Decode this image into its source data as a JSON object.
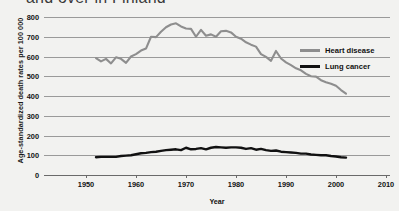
{
  "title": "and over in Finland",
  "chart_data": {
    "type": "line",
    "title": "and over in Finland",
    "xlabel": "Year",
    "ylabel": "Age-standardized death rates per 100 000",
    "xlim": [
      1941.6,
      2010.8
    ],
    "ylim": [
      0,
      800
    ],
    "xticks": [
      1950,
      1960,
      1970,
      1980,
      1990,
      2000,
      2010
    ],
    "yticks": [
      0,
      100,
      200,
      300,
      400,
      500,
      600,
      700,
      800
    ],
    "grid": true,
    "legend_position": "right",
    "colors": {
      "heart_disease": "#8e8e8e",
      "lung_cancer": "#111111",
      "gridline": "#9a9a9a",
      "background": "#f2f2f0"
    },
    "series": [
      {
        "name": "Heart disease",
        "color": "#8e8e8e",
        "x": [
          1952,
          1953,
          1954,
          1955,
          1956,
          1957,
          1958,
          1959,
          1960,
          1961,
          1962,
          1963,
          1964,
          1965,
          1966,
          1967,
          1968,
          1969,
          1970,
          1971,
          1972,
          1973,
          1974,
          1975,
          1976,
          1977,
          1978,
          1979,
          1980,
          1981,
          1982,
          1983,
          1984,
          1985,
          1986,
          1987,
          1988,
          1989,
          1990,
          1991,
          1992,
          1993,
          1994,
          1995,
          1996,
          1997,
          1998,
          1999,
          2000,
          2001,
          2002
        ],
        "values": [
          592,
          575,
          588,
          565,
          596,
          588,
          568,
          600,
          612,
          630,
          640,
          700,
          698,
          725,
          748,
          762,
          768,
          752,
          742,
          740,
          700,
          735,
          705,
          712,
          700,
          728,
          730,
          722,
          700,
          690,
          672,
          660,
          650,
          612,
          598,
          578,
          628,
          590,
          570,
          556,
          540,
          530,
          512,
          500,
          498,
          480,
          470,
          462,
          452,
          430,
          412
        ]
      },
      {
        "name": "Lung cancer",
        "color": "#111111",
        "x": [
          1952,
          1953,
          1954,
          1955,
          1956,
          1957,
          1958,
          1959,
          1960,
          1961,
          1962,
          1963,
          1964,
          1965,
          1966,
          1967,
          1968,
          1969,
          1970,
          1971,
          1972,
          1973,
          1974,
          1975,
          1976,
          1977,
          1978,
          1979,
          1980,
          1981,
          1982,
          1983,
          1984,
          1985,
          1986,
          1987,
          1988,
          1989,
          1990,
          1991,
          1992,
          1993,
          1994,
          1995,
          1996,
          1997,
          1998,
          1999,
          2000,
          2001,
          2002
        ],
        "values": [
          90,
          92,
          92,
          92,
          92,
          96,
          98,
          100,
          105,
          110,
          112,
          116,
          118,
          122,
          126,
          128,
          130,
          126,
          138,
          130,
          132,
          136,
          130,
          138,
          142,
          140,
          138,
          140,
          140,
          138,
          132,
          136,
          128,
          132,
          126,
          122,
          124,
          118,
          116,
          114,
          112,
          108,
          108,
          104,
          102,
          100,
          100,
          96,
          94,
          90,
          88
        ]
      }
    ]
  },
  "legend": {
    "items": [
      {
        "label": "Heart disease",
        "color": "#8e8e8e"
      },
      {
        "label": "Lung cancer",
        "color": "#111111"
      }
    ]
  }
}
